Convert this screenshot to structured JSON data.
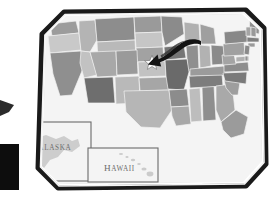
{
  "illustration": {
    "title": "Framed United States map",
    "type": "map-illustration",
    "frame": {
      "style": "beveled-octagonal-frame",
      "outer_border_color": "#1a1a1a",
      "inner_border_color": "#cfcfcf",
      "mat_color": "#ffffff",
      "page_background": "#ffffff"
    },
    "map": {
      "region": "United States",
      "background_color": "#f4f4f4",
      "palette": {
        "very_light": "#d6d6d6",
        "light": "#c4c4c4",
        "medium_light": "#b2b2b2",
        "medium": "#9e9e9e",
        "medium_dark": "#8a8a8a",
        "dark": "#6f6f6f",
        "very_dark": "#4f4f4f",
        "outline": "#f2f2f2"
      },
      "states": [
        {
          "name": "Washington",
          "tone": "#9c9c9c"
        },
        {
          "name": "Oregon",
          "tone": "#c9c9c9"
        },
        {
          "name": "Idaho",
          "tone": "#b4b4b4"
        },
        {
          "name": "Montana",
          "tone": "#8d8d8d"
        },
        {
          "name": "Wyoming",
          "tone": "#b9b9b9"
        },
        {
          "name": "North Dakota",
          "tone": "#9a9a9a"
        },
        {
          "name": "South Dakota",
          "tone": "#c6c6c6"
        },
        {
          "name": "Nebraska",
          "tone": "#a2a2a2"
        },
        {
          "name": "Minnesota",
          "tone": "#8b8b8b"
        },
        {
          "name": "Iowa",
          "tone": "#757575"
        },
        {
          "name": "Wisconsin",
          "tone": "#b0b0b0"
        },
        {
          "name": "Illinois",
          "tone": "#8f8f8f"
        },
        {
          "name": "Michigan",
          "tone": "#9f9f9f"
        },
        {
          "name": "California",
          "tone": "#8f8f8f"
        },
        {
          "name": "Nevada",
          "tone": "#c2c2c2"
        },
        {
          "name": "Utah",
          "tone": "#a8a8a8"
        },
        {
          "name": "Colorado",
          "tone": "#9a9a9a"
        },
        {
          "name": "Kansas",
          "tone": "#c2c2c2"
        },
        {
          "name": "Missouri",
          "tone": "#6a6a6a"
        },
        {
          "name": "Arizona",
          "tone": "#6e6e6e"
        },
        {
          "name": "New Mexico",
          "tone": "#b9b9b9"
        },
        {
          "name": "Oklahoma",
          "tone": "#a6a6a6"
        },
        {
          "name": "Arkansas",
          "tone": "#8c8c8c"
        },
        {
          "name": "Texas",
          "tone": "#b6b6b6"
        },
        {
          "name": "Louisiana",
          "tone": "#a8a8a8"
        },
        {
          "name": "Mississippi",
          "tone": "#bdbdbd"
        },
        {
          "name": "Alabama",
          "tone": "#8e8e8e"
        },
        {
          "name": "Tennessee",
          "tone": "#7d7d7d"
        },
        {
          "name": "Kentucky",
          "tone": "#9b9b9b"
        },
        {
          "name": "Indiana",
          "tone": "#b2b2b2"
        },
        {
          "name": "Ohio",
          "tone": "#8a8a8a"
        },
        {
          "name": "West Virginia",
          "tone": "#a4a4a4"
        },
        {
          "name": "Virginia",
          "tone": "#8d8d8d"
        },
        {
          "name": "North Carolina",
          "tone": "#7a7a7a"
        },
        {
          "name": "South Carolina",
          "tone": "#9e9e9e"
        },
        {
          "name": "Georgia",
          "tone": "#a9a9a9"
        },
        {
          "name": "Florida",
          "tone": "#9b9b9b"
        },
        {
          "name": "Pennsylvania",
          "tone": "#a0a0a0"
        },
        {
          "name": "New York",
          "tone": "#888888"
        },
        {
          "name": "Maine",
          "tone": "#909090"
        },
        {
          "name": "Vermont",
          "tone": "#a5a5a5"
        },
        {
          "name": "New Hampshire",
          "tone": "#999999"
        },
        {
          "name": "Massachusetts",
          "tone": "#7f7f7f"
        },
        {
          "name": "Connecticut",
          "tone": "#9a9a9a"
        },
        {
          "name": "New Jersey",
          "tone": "#8a8a8a"
        },
        {
          "name": "Maryland",
          "tone": "#b0b0b0"
        },
        {
          "name": "Delaware",
          "tone": "#949494"
        }
      ],
      "marker": {
        "type": "star",
        "color": "#ffffff",
        "outline": "#5a5a5a",
        "placed_on": "Missouri",
        "label": "capital-star-marker"
      },
      "pointer": {
        "type": "arrow",
        "color": "#141414",
        "direction": "down-left",
        "points_to": "capital-star-marker"
      }
    },
    "insets": [
      {
        "id": "alaska",
        "label": "Alaska",
        "label_display": "ALASKA",
        "shape_tone": "#c9c9c9",
        "box_border": "#6b6b6b",
        "box_fill": "#f4f4f4"
      },
      {
        "id": "hawaii",
        "label": "Hawaii",
        "label_display": "HAWAII",
        "shape_tone": "#c9c9c9",
        "box_border": "#6b6b6b",
        "box_fill": "#f4f4f4"
      }
    ],
    "overlays": [
      {
        "id": "left-edge-arrow-tip",
        "type": "arrow-fragment",
        "color": "#2b2b2b",
        "note": "cropped at left edge"
      },
      {
        "id": "left-edge-block",
        "type": "solid-block",
        "color": "#0d0d0d",
        "note": "cropped at lower-left edge"
      }
    ]
  }
}
